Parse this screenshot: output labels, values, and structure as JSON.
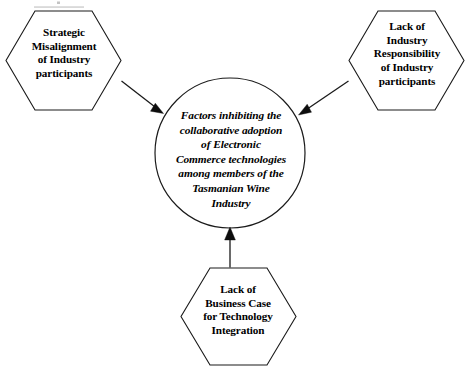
{
  "diagram": {
    "type": "hub-and-spoke concept diagram",
    "background_color": "#ffffff",
    "line_color": "#1a1a1a",
    "text_color": "#000000",
    "center": {
      "id": "center-circle",
      "shape": "circle",
      "text": "Factors inhibiting the\ncollaborative adoption\nof Electronic\nCommerce technologies\namong members of the\nTasmanian Wine\nIndustry",
      "lines": [
        "Factors inhibiting the",
        "collaborative adoption",
        "of Electronic",
        "Commerce technologies",
        "among members of the",
        "Tasmanian Wine",
        "Industry"
      ]
    },
    "nodes": [
      {
        "id": "hex-top-left",
        "shape": "hexagon",
        "position": "top-left",
        "text": "Strategic\nMisalignment\nof Industry\nparticipants",
        "lines": [
          "Strategic",
          "Misalignment",
          "of Industry",
          "participants"
        ]
      },
      {
        "id": "hex-top-right",
        "shape": "hexagon",
        "position": "top-right",
        "text": "Lack of\nIndustry\nResponsibility\nof Industry\nparticipants",
        "lines": [
          "Lack of",
          "Industry",
          "Responsibility",
          "of Industry",
          "participants"
        ]
      },
      {
        "id": "hex-bottom",
        "shape": "hexagon",
        "position": "bottom-center",
        "text": "Lack of\nBusiness Case\nfor Technology\nIntegration",
        "lines": [
          "Lack of",
          "Business Case",
          "for Technology",
          "Integration"
        ]
      }
    ],
    "connectors": [
      {
        "id": "arrow-left-to-center",
        "from": "hex-top-left",
        "to": "center-circle",
        "direction": "down-right",
        "arrowhead": "filled-triangle"
      },
      {
        "id": "arrow-right-to-center",
        "from": "hex-top-right",
        "to": "center-circle",
        "direction": "down-left",
        "arrowhead": "filled-triangle"
      },
      {
        "id": "arrow-bottom-to-center",
        "from": "hex-bottom",
        "to": "center-circle",
        "direction": "up",
        "arrowhead": "filled-triangle"
      }
    ]
  }
}
